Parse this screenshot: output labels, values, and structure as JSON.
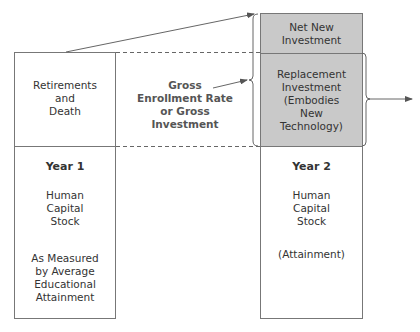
{
  "diagram": {
    "left_column": {
      "top_label": "Retirements\nand\nDeath",
      "year": "Year 1",
      "stock": "Human\nCapital\nStock",
      "measure": "As Measured\nby Average\nEducational\nAttainment"
    },
    "middle_label": "Gross\nEnrollment Rate\nor Gross\nInvestment",
    "right_column": {
      "net_new": "Net New\nInvestment",
      "replacement": "Replacement\nInvestment\n(Embodies\nNew\nTechnology)",
      "year": "Year 2",
      "stock": "Human\nCapital\nStock",
      "measure": "(Attainment)"
    },
    "colors": {
      "line": "#777777",
      "shaded": "#c9c9c9",
      "text": "#333333",
      "label": "#555555"
    }
  }
}
